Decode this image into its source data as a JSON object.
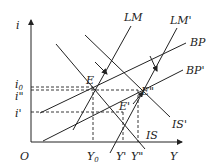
{
  "diagram": {
    "type": "IS-LM-BP",
    "axes": {
      "y_label": "i",
      "x_label": "Y",
      "origin_label": "O",
      "y_ticks": [
        {
          "label": "i",
          "sub": "0",
          "y": 86
        },
        {
          "label": "i\"",
          "sub": "",
          "y": 91
        },
        {
          "label": "i'",
          "sub": "",
          "y": 112
        }
      ],
      "x_ticks": [
        {
          "label": "Y",
          "sub": "0",
          "x": 93
        },
        {
          "label": "Y'",
          "sub": "",
          "x": 123
        },
        {
          "label": "Y\"",
          "sub": "",
          "x": 138
        }
      ]
    },
    "curves": [
      {
        "name": "LM",
        "label": "LM"
      },
      {
        "name": "LM'",
        "label": "LM'"
      },
      {
        "name": "BP",
        "label": "BP"
      },
      {
        "name": "BP'",
        "label": "BP'"
      },
      {
        "name": "IS",
        "label": "IS"
      },
      {
        "name": "IS'",
        "label": "IS'"
      }
    ],
    "points": [
      {
        "label": "E"
      },
      {
        "label": "E'"
      },
      {
        "label": "E\""
      }
    ]
  },
  "text": {
    "i_axis": "i",
    "y_axis": "Y",
    "origin": "O",
    "i0_main": "i",
    "i0_sub": "0",
    "i_dprime": "i\"",
    "i_prime": "i'",
    "Y0_main": "Y",
    "Y0_sub": "0",
    "Y_prime": "Y'",
    "Y_dprime": "Y\"",
    "LM": "LM",
    "LM_prime": "LM'",
    "BP": "BP",
    "BP_prime": "BP'",
    "IS": "IS",
    "IS_prime": "IS'",
    "E": "E",
    "E_prime": "E'",
    "E_dprime": "E\""
  }
}
